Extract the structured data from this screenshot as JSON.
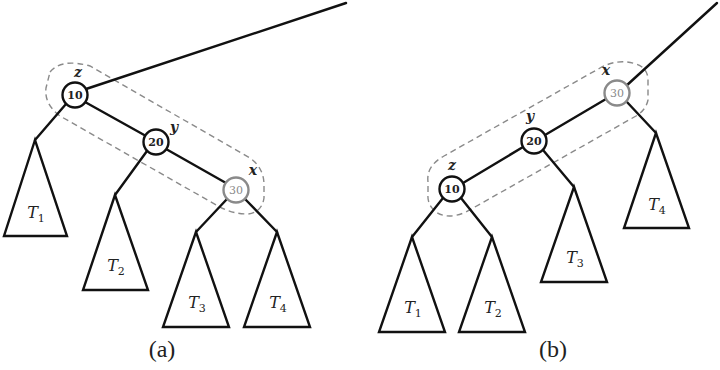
{
  "figure": {
    "panel_a": {
      "caption": "(a)",
      "nodes": [
        {
          "id": "z",
          "key": "10",
          "label": "z",
          "highlight": false
        },
        {
          "id": "y",
          "key": "20",
          "label": "y",
          "highlight": false
        },
        {
          "id": "x",
          "key": "30",
          "label": "x",
          "highlight": true
        }
      ],
      "subtrees": [
        {
          "name": "T",
          "sub": "1"
        },
        {
          "name": "T",
          "sub": "2"
        },
        {
          "name": "T",
          "sub": "3"
        },
        {
          "name": "T",
          "sub": "4"
        }
      ]
    },
    "panel_b": {
      "caption": "(b)",
      "nodes": [
        {
          "id": "z",
          "key": "10",
          "label": "z",
          "highlight": false
        },
        {
          "id": "y",
          "key": "20",
          "label": "y",
          "highlight": false
        },
        {
          "id": "x",
          "key": "30",
          "label": "x",
          "highlight": true
        }
      ],
      "subtrees": [
        {
          "name": "T",
          "sub": "1"
        },
        {
          "name": "T",
          "sub": "2"
        },
        {
          "name": "T",
          "sub": "3"
        },
        {
          "name": "T",
          "sub": "4"
        }
      ]
    },
    "colors": {
      "line": "#111111",
      "highlight_node": "#8a8a8a",
      "dashed_outline": "#8a8a8a"
    }
  }
}
